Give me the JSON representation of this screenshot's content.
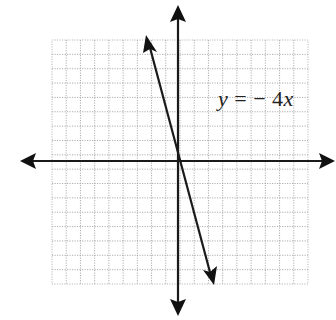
{
  "chart_data": {
    "type": "line",
    "title": "",
    "equation_label": {
      "y": "y",
      "equals": "=",
      "minus": "−",
      "coefficient": "4",
      "x": "x"
    },
    "equation_text": "y = −4x",
    "function": {
      "slope": -4,
      "intercept": 0
    },
    "series": [
      {
        "name": "y = -4x",
        "x": [
          -2.5,
          0,
          2.5
        ],
        "y": [
          10,
          0,
          -10
        ]
      }
    ],
    "xlabel": "",
    "ylabel": "",
    "grid": true,
    "grid_cells": {
      "columns": 18,
      "rows": 17
    },
    "axes": {
      "x_arrows": "both",
      "y_arrows": "both",
      "tick_labels": "none"
    },
    "line_arrows": "both",
    "colors": {
      "axis": "#1a1a1a",
      "line": "#1a1a1a",
      "grid": "#9a9a9a",
      "background": "#ffffff"
    }
  }
}
